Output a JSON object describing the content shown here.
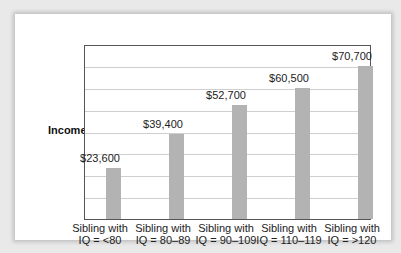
{
  "chart_data": {
    "type": "bar",
    "title": "",
    "xlabel": "",
    "ylabel": "Income",
    "categories": [
      "Sibling with IQ = <80",
      "Sibling with IQ = 80–89",
      "Sibling with IQ = 90–109",
      "Sibling with IQ = 110–119",
      "Sibling with IQ = >120"
    ],
    "values": [
      23600,
      39400,
      52700,
      60500,
      70700
    ],
    "value_labels": [
      "$23,600",
      "$39,400",
      "$52,700",
      "$60,500",
      "$70,700"
    ],
    "ylim": [
      0,
      80000
    ],
    "grid": true,
    "gridlines": 8,
    "legend": null,
    "bar_color": "#b3b3b3"
  },
  "axis": {
    "ylabel": "Income"
  },
  "bars": [
    {
      "label_line1": "Sibling with",
      "label_line2": "IQ = <80",
      "value_label": "$23,600",
      "value": 23600
    },
    {
      "label_line1": "Sibling with",
      "label_line2": "IQ = 80–89",
      "value_label": "$39,400",
      "value": 39400
    },
    {
      "label_line1": "Sibling with",
      "label_line2": "IQ = 90–109",
      "value_label": "$52,700",
      "value": 52700
    },
    {
      "label_line1": "Sibling with",
      "label_line2": "IQ = 110–119",
      "value_label": "$60,500",
      "value": 60500
    },
    {
      "label_line1": "Sibling with",
      "label_line2": "IQ = >120",
      "value_label": "$70,700",
      "value": 70700
    }
  ]
}
